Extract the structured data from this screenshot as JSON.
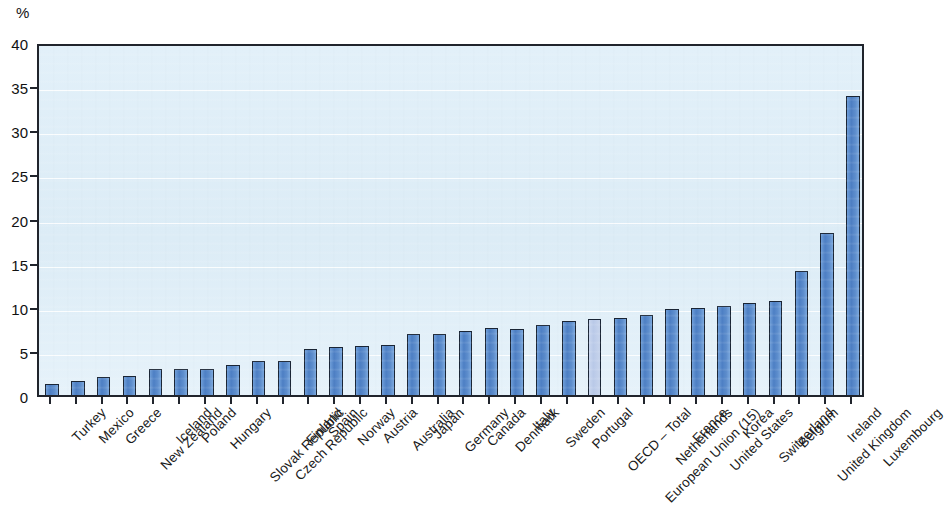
{
  "chart_data": {
    "type": "bar",
    "title": "",
    "subtitle": "",
    "xlabel": "",
    "ylabel": "%",
    "y_unit_label": "%",
    "ylim": [
      0,
      40
    ],
    "ytick_values": [
      0,
      5,
      10,
      15,
      20,
      25,
      30,
      35,
      40
    ],
    "ytick_labels": [
      "0",
      "5",
      "10",
      "15",
      "20",
      "25",
      "30",
      "35",
      "40"
    ],
    "grid": true,
    "grid_axis": "y",
    "legend": "none",
    "legend_position": "none",
    "annotations": [],
    "highlight_category": "OECD – Total",
    "categories": [
      "Turkey",
      "Mexico",
      "Greece",
      "New Zealand",
      "Iceland",
      "Poland",
      "Hungary",
      "Slovak Republic",
      "Czech Republic",
      "Finland",
      "Spain",
      "Norway",
      "Austria",
      "Australia",
      "Japan",
      "Germany",
      "Canada",
      "Denmark",
      "Italy",
      "Sweden",
      "Portugal",
      "OECD – Total",
      "European Union (15)",
      "Netherlands",
      "France",
      "United States",
      "Korea",
      "Switzerland",
      "Belgium",
      "United Kingdom",
      "Ireland",
      "Luxembourg"
    ],
    "values": [
      1.3,
      1.6,
      2.0,
      2.1,
      2.9,
      2.9,
      3.0,
      3.4,
      3.8,
      3.9,
      5.2,
      5.4,
      5.5,
      5.7,
      6.9,
      6.9,
      7.3,
      7.6,
      7.5,
      7.9,
      8.4,
      8.6,
      8.7,
      9.1,
      9.7,
      9.9,
      10.1,
      10.4,
      10.6,
      14.1,
      18.4,
      33.9
    ]
  },
  "style": {
    "bar_color": "#5382c7",
    "bar_highlight_color": "#c2d1ea",
    "bar_border_color": "#1a2535",
    "plot_background": "#dcecf6",
    "gridline_color": "#ffffff",
    "axis_color": "#20242c",
    "text_color": "#1a1a1a"
  }
}
